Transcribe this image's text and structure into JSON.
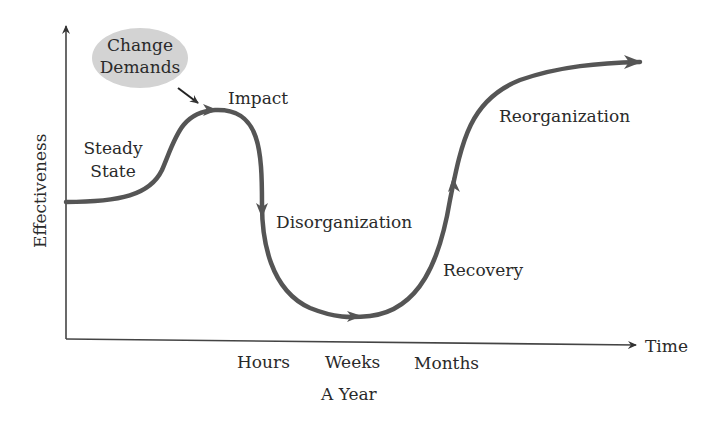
{
  "diagram": {
    "y_axis_label": "Effectiveness",
    "x_axis_label": "Time",
    "x_ticks": [
      "Hours",
      "Weeks",
      "Months"
    ],
    "x_subtick": "A Year",
    "bubble": {
      "line1": "Change",
      "line2": "Demands",
      "color": "#d3d3d3"
    },
    "stages": {
      "steady_line1": "Steady",
      "steady_line2": "State",
      "impact": "Impact",
      "disorganization": "Disorganization",
      "recovery": "Recovery",
      "reorganization": "Reorganization"
    },
    "curve_color": "#555555",
    "axis_color": "#444444"
  }
}
